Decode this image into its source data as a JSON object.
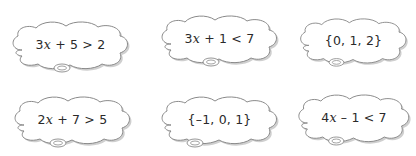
{
  "clouds": [
    {
      "id": "cloud-1",
      "text": "3x + 5 > 2",
      "parts": [
        "3",
        "x",
        " + 5 > 2"
      ]
    },
    {
      "id": "cloud-2",
      "text": "3x + 1 < 7",
      "parts": [
        "3",
        "x",
        " + 1 < 7"
      ]
    },
    {
      "id": "cloud-3",
      "text": "{0, 1, 2}",
      "parts": [
        "{0, 1, 2}",
        "",
        ""
      ]
    },
    {
      "id": "cloud-4",
      "text": "2x + 7 > 5",
      "parts": [
        "2",
        "x",
        " + 7 > 5"
      ]
    },
    {
      "id": "cloud-5",
      "text": "{-1, 0, 1}",
      "parts": [
        "{–1, 0, 1}",
        "",
        ""
      ]
    },
    {
      "id": "cloud-6",
      "text": "4x - 1 < 7",
      "parts": [
        "4",
        "x",
        " – 1 < 7"
      ]
    }
  ],
  "colors": {
    "outline": "#8a8a8a",
    "shadow": "#c8c8c8",
    "fill": "#ffffff",
    "text": "#2a2a2a"
  }
}
